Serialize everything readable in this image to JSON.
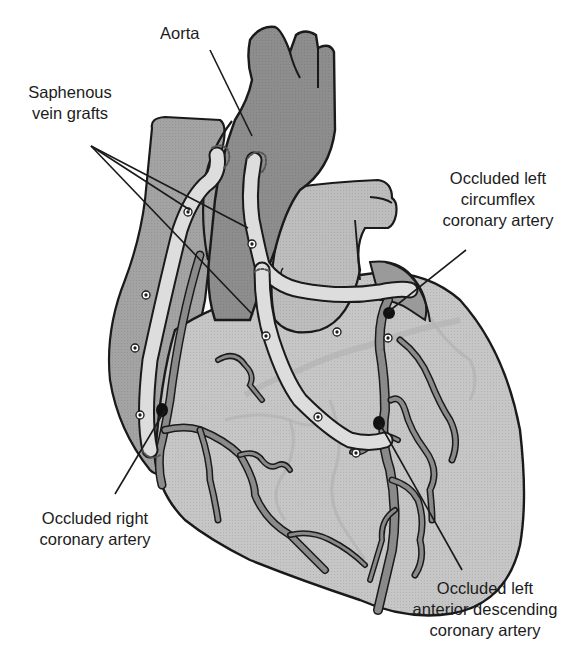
{
  "figure": {
    "labels": {
      "aorta": {
        "lines": [
          "Aorta"
        ]
      },
      "saphenous_vein_grafts": {
        "lines": [
          "Saphenous",
          "vein grafts"
        ]
      },
      "occluded_left_circumflex": {
        "lines": [
          "Occluded left",
          "circumflex",
          "coronary artery"
        ]
      },
      "occluded_right_coronary": {
        "lines": [
          "Occluded right",
          "coronary artery"
        ]
      },
      "occluded_left_anterior_descending": {
        "lines": [
          "Occluded left",
          "anterior descending",
          "coronary artery"
        ]
      }
    },
    "colors": {
      "outline": "#1a1a1a",
      "aorta_fill": "#8c8c8c",
      "atrium_fill": "#a6a6a6",
      "ventricle_fill": "#c4c4c4",
      "pulmonary_fill": "#b5b5b5",
      "graft_fill": "#dcdcdc",
      "artery_fill": "#8a8a8a",
      "occlusion": "#111111",
      "background": "#ffffff"
    }
  }
}
